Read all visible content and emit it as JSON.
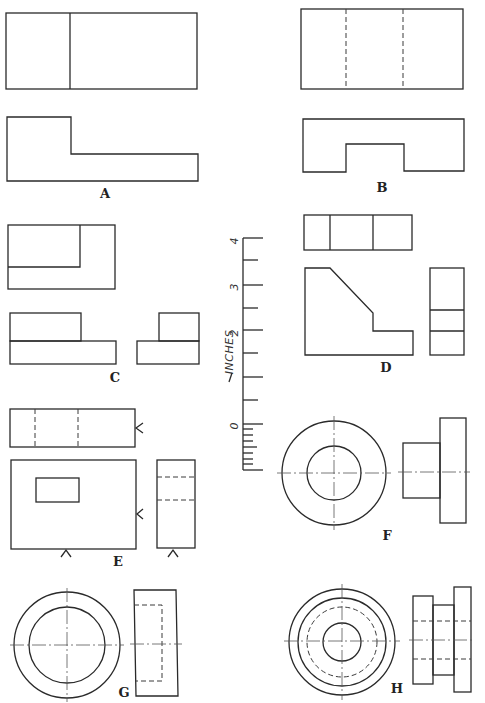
{
  "figures": [
    {
      "id": "A",
      "label": "A",
      "views": [
        "top-view",
        "front-view"
      ]
    },
    {
      "id": "B",
      "label": "B",
      "views": [
        "top-view",
        "front-view"
      ]
    },
    {
      "id": "C",
      "label": "C",
      "views": [
        "top-view",
        "front-view",
        "side-view"
      ]
    },
    {
      "id": "D",
      "label": "D",
      "views": [
        "top-view",
        "front-view",
        "side-view"
      ]
    },
    {
      "id": "E",
      "label": "E",
      "views": [
        "top-view",
        "front-view",
        "side-view"
      ]
    },
    {
      "id": "F",
      "label": "F",
      "views": [
        "end-view",
        "side-view"
      ]
    },
    {
      "id": "G",
      "label": "G",
      "views": [
        "end-view",
        "side-view"
      ]
    },
    {
      "id": "H",
      "label": "H",
      "views": [
        "end-view",
        "side-view"
      ]
    }
  ],
  "scale": {
    "title": "INCHES",
    "ticks": [
      "0",
      "1",
      "2",
      "3",
      "4"
    ],
    "tick_labels_shown": [
      "0",
      "2",
      "3",
      "4"
    ]
  },
  "colors": {
    "line": "#2a2a2a",
    "background": "#ffffff"
  }
}
